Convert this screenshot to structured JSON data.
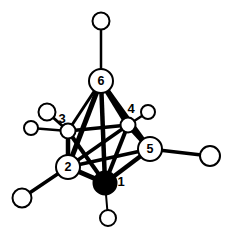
{
  "figure": {
    "kind": "molecular-structure-diagram",
    "background_color": "#ffffff",
    "line_color": "#000000",
    "cluster_vertex_fill": "#ffffff",
    "filled_vertex_fill": "#000000",
    "hydrogen_fill": "#ffffff"
  },
  "cluster_vertices": [
    {
      "id": "v1",
      "label": "1",
      "cx": 105,
      "cy": 183,
      "r": 11.5,
      "filled": true,
      "label_x": 121,
      "label_y": 181,
      "label_outside": true
    },
    {
      "id": "v2",
      "label": "2",
      "cx": 68,
      "cy": 167,
      "r": 12.0,
      "filled": false,
      "label_x": 68,
      "label_y": 167,
      "label_outside": false
    },
    {
      "id": "v3",
      "label": "3",
      "cx": 68,
      "cy": 131,
      "r": 7.5,
      "filled": false,
      "label_x": 62,
      "label_y": 118,
      "label_outside": true
    },
    {
      "id": "v4",
      "label": "4",
      "cx": 128,
      "cy": 125,
      "r": 7.5,
      "filled": false,
      "label_x": 131,
      "label_y": 108,
      "label_outside": true
    },
    {
      "id": "v5",
      "label": "5",
      "cx": 150,
      "cy": 149,
      "r": 12.0,
      "filled": false,
      "label_x": 150,
      "label_y": 149,
      "label_outside": false
    },
    {
      "id": "v6",
      "label": "6",
      "cx": 101,
      "cy": 81,
      "r": 12.0,
      "filled": false,
      "label_x": 101,
      "label_y": 81,
      "label_outside": false
    }
  ],
  "hydrogens": [
    {
      "id": "h6",
      "cx": 101,
      "cy": 21,
      "r": 8.5,
      "attached_to": "v6"
    },
    {
      "id": "h3",
      "cx": 47,
      "cy": 112,
      "r": 8.5,
      "attached_to": "v3"
    },
    {
      "id": "h3b",
      "cx": 31,
      "cy": 128,
      "r": 7.0,
      "attached_to": "v3"
    },
    {
      "id": "h2",
      "cx": 22,
      "cy": 198,
      "r": 9.5,
      "attached_to": "v2"
    },
    {
      "id": "h1",
      "cx": 108,
      "cy": 218,
      "r": 8.0,
      "attached_to": "v1"
    },
    {
      "id": "h4",
      "cx": 148,
      "cy": 112,
      "r": 7.0,
      "attached_to": "v4"
    },
    {
      "id": "h5",
      "cx": 210,
      "cy": 156,
      "r": 10.0,
      "attached_to": "v5"
    }
  ],
  "cluster_bonds": [
    {
      "from": "v6",
      "to": "v2",
      "width": 5.0
    },
    {
      "from": "v6",
      "to": "v3",
      "width": 3.0
    },
    {
      "from": "v6",
      "to": "v4",
      "width": 5.5
    },
    {
      "from": "v6",
      "to": "v5",
      "width": 4.0
    },
    {
      "from": "v6",
      "to": "v1",
      "width": 4.5
    },
    {
      "from": "v3",
      "to": "v2",
      "width": 4.5
    },
    {
      "from": "v3",
      "to": "v4",
      "width": 3.5
    },
    {
      "from": "v3",
      "to": "v1",
      "width": 4.0
    },
    {
      "from": "v2",
      "to": "v5",
      "width": 3.5
    },
    {
      "from": "v2",
      "to": "v4",
      "width": 3.5
    },
    {
      "from": "v2",
      "to": "v1",
      "width": 5.0
    },
    {
      "from": "v4",
      "to": "v5",
      "width": 5.0
    },
    {
      "from": "v4",
      "to": "v1",
      "width": 4.0
    },
    {
      "from": "v5",
      "to": "v1",
      "width": 4.5
    }
  ],
  "hydrogen_bonds": [
    {
      "from": "v6",
      "to": "h6",
      "width": 2.5
    },
    {
      "from": "v3",
      "to": "h3",
      "width": 3.0
    },
    {
      "from": "v3",
      "to": "h3b",
      "width": 2.5
    },
    {
      "from": "v2",
      "to": "h2",
      "width": 3.5
    },
    {
      "from": "v1",
      "to": "h1",
      "width": 2.0
    },
    {
      "from": "v4",
      "to": "h4",
      "width": 2.5
    },
    {
      "from": "v5",
      "to": "h5",
      "width": 3.5
    }
  ],
  "stroke": {
    "vertex_outline_width": 2.0,
    "hydrogen_outline_width": 2.0
  }
}
